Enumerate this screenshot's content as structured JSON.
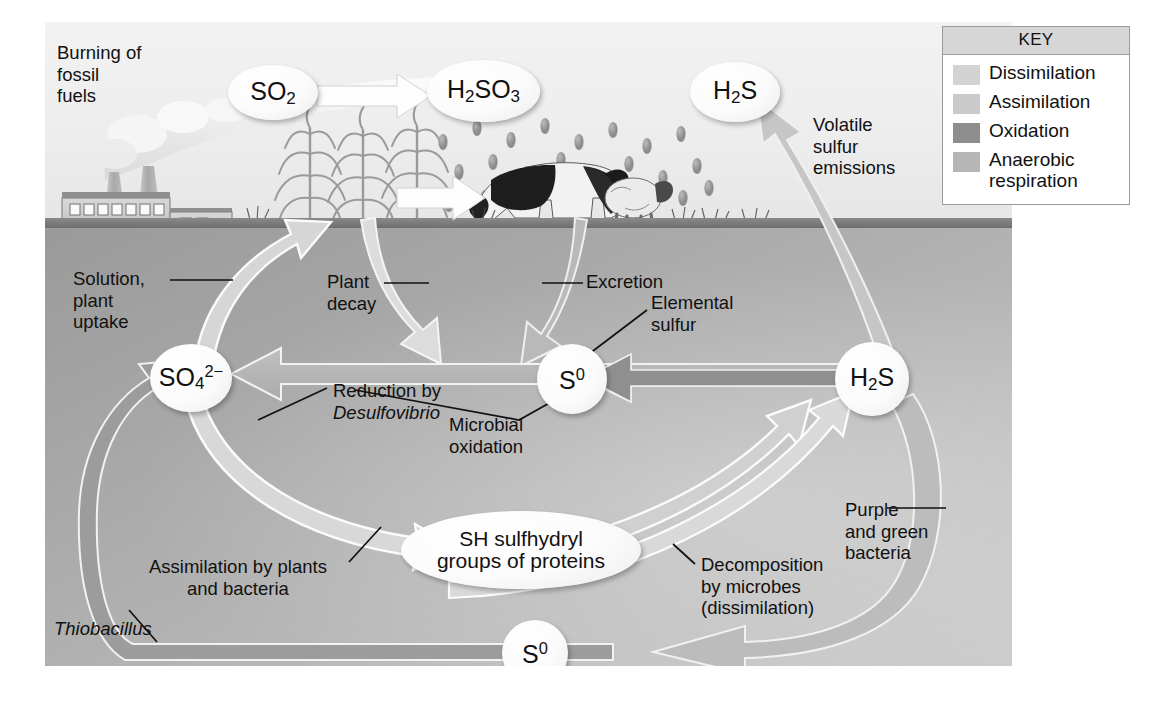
{
  "figure": {
    "ground_label": "soil surface"
  },
  "key": {
    "header": "KEY",
    "items": [
      {
        "label": "Dissimilation",
        "color": "#d3d3d3"
      },
      {
        "label": "Assimilation",
        "color": "#cacaca"
      },
      {
        "label": "Oxidation",
        "color": "#8e8e8e"
      },
      {
        "label": "Anaerobic\nrespiration",
        "color": "#b6b6b6"
      }
    ]
  },
  "nodes": {
    "so2": {
      "formula_main": "SO",
      "sub": "2",
      "sup": "",
      "shape": "ellipse"
    },
    "h2so3": {
      "pre": "H",
      "pre_sub": "2",
      "mid": "SO",
      "mid_sub": "3",
      "shape": "ellipse"
    },
    "h2s_air": {
      "pre": "H",
      "pre_sub": "2",
      "mid": "S",
      "shape": "ellipse"
    },
    "sulfate": {
      "main": "SO",
      "sub": "4",
      "sup": "2−",
      "shape": "circle"
    },
    "s0_center": {
      "main": "S",
      "sup": "0",
      "shape": "circle"
    },
    "h2s_soil": {
      "pre": "H",
      "pre_sub": "2",
      "mid": "S",
      "shape": "circle"
    },
    "sh_protein": {
      "line1": "SH sulfhydryl",
      "line2": "groups of proteins",
      "shape": "ellipse"
    },
    "s0_bottom": {
      "main": "S",
      "sup": "0",
      "shape": "circle"
    }
  },
  "labels": {
    "burning": "Burning of\nfossil\nfuels",
    "volatile": "Volatile\nsulfur\nemissions",
    "solution": "Solution,\nplant\nuptake",
    "plant_decay": "Plant\ndecay",
    "excretion": "Excretion",
    "elemental_sulfur": "Elemental\nsulfur",
    "reduction": "Reduction by",
    "reduction_organism": "Desulfovibrio",
    "microbial_oxidation": "Microbial\noxidation",
    "assimilation": "Assimilation by plants\nand bacteria",
    "decomposition": "Decomposition\nby microbes\n(dissimilation)",
    "purple_green": "Purple\nand green\nbacteria",
    "thiobacillus": "Thiobacillus"
  },
  "scene": {
    "factory": "factory-with-smokestacks",
    "crops": "corn-plants",
    "livestock": "grazing-cow-and-sheep",
    "rain": "acid-rain-droplets"
  },
  "colors": {
    "sky": "#eeeeee",
    "ground_line": "#757575",
    "soil_light": "#c9c9c9",
    "soil_dark": "#9a9a9a",
    "arrow_dissimilation": "#d7d7d7",
    "arrow_assimilation": "#cfcfcf",
    "arrow_oxidation": "#8e8e8e",
    "arrow_anaerobic": "#b6b6b6",
    "node_fill": "#fbfbfb",
    "text": "#111111"
  }
}
